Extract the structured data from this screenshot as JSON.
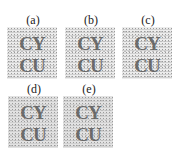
{
  "panels": [
    {
      "label": "(a)",
      "line1": "CY",
      "line2": "CU"
    },
    {
      "label": "(b)",
      "line1": "CY",
      "line2": "CU"
    },
    {
      "label": "(c)",
      "line1": "CY",
      "line2": "CU"
    },
    {
      "label": "(d)",
      "line1": "CY",
      "line2": "CU"
    },
    {
      "label": "(e)",
      "line1": "CY",
      "line2": "CU"
    }
  ]
}
